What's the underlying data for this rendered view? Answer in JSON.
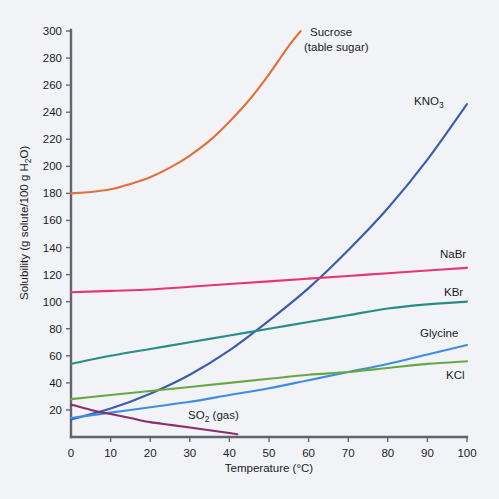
{
  "chart_data": {
    "type": "line",
    "title": "",
    "xlabel": "Temperature (°C)",
    "ylabel": "Solubility (g solute/100 g H₂O)",
    "xlim": [
      0,
      100
    ],
    "ylim": [
      0,
      300
    ],
    "grid": false,
    "legend_position": "inline-end-of-curve",
    "xticks": [
      0,
      10,
      20,
      30,
      40,
      50,
      60,
      70,
      80,
      90,
      100
    ],
    "yticks": [
      0,
      20,
      40,
      60,
      80,
      100,
      120,
      140,
      160,
      180,
      200,
      220,
      240,
      260,
      280,
      300
    ],
    "xtick_labels": [
      "0",
      "10",
      "20",
      "30",
      "40",
      "50",
      "60",
      "70",
      "80",
      "90",
      "100"
    ],
    "ytick_labels": [
      "",
      "20",
      "40",
      "60",
      "80",
      "100",
      "120",
      "140",
      "160",
      "180",
      "200",
      "220",
      "240",
      "260",
      "280",
      "300"
    ],
    "series": [
      {
        "name": "Sucrose (table sugar)",
        "label_lines": [
          "Sucrose",
          "(table sugar)"
        ],
        "color": "#e2703a",
        "x": [
          0,
          5,
          10,
          15,
          20,
          25,
          30,
          35,
          40,
          45,
          50,
          55,
          58
        ],
        "values": [
          180,
          181,
          183,
          187,
          192,
          199,
          208,
          219,
          233,
          249,
          268,
          289,
          300
        ]
      },
      {
        "name": "KNO3",
        "label_lines": [
          "KNO",
          "3"
        ],
        "color": "#3b5ca8",
        "x": [
          0,
          10,
          20,
          30,
          40,
          50,
          60,
          70,
          80,
          90,
          100
        ],
        "values": [
          13,
          21,
          32,
          46,
          64,
          86,
          110,
          138,
          169,
          205,
          246
        ]
      },
      {
        "name": "NaBr",
        "label_lines": [
          "NaBr"
        ],
        "color": "#e8356d",
        "x": [
          0,
          10,
          20,
          30,
          40,
          50,
          60,
          70,
          80,
          90,
          100
        ],
        "values": [
          107,
          108,
          109,
          111,
          113,
          115,
          117,
          119,
          121,
          123,
          125
        ]
      },
      {
        "name": "KBr",
        "label_lines": [
          "KBr"
        ],
        "color": "#2a8c86",
        "x": [
          0,
          10,
          20,
          30,
          40,
          50,
          60,
          70,
          80,
          90,
          100
        ],
        "values": [
          54,
          60,
          65,
          70,
          75,
          80,
          85,
          90,
          95,
          98,
          100
        ]
      },
      {
        "name": "Glycine",
        "label_lines": [
          "Glycine"
        ],
        "color": "#3c8fe0",
        "x": [
          0,
          10,
          20,
          30,
          40,
          50,
          60,
          70,
          80,
          90,
          100
        ],
        "values": [
          14,
          18,
          22,
          26,
          31,
          36,
          42,
          48,
          54,
          61,
          68
        ]
      },
      {
        "name": "KCl",
        "label_lines": [
          "KCl"
        ],
        "color": "#67a844",
        "x": [
          0,
          10,
          20,
          30,
          40,
          50,
          60,
          70,
          80,
          90,
          100
        ],
        "values": [
          28,
          31,
          34,
          37,
          40,
          43,
          46,
          48,
          51,
          54,
          56
        ]
      },
      {
        "name": "SO2 (gas)",
        "label_lines": [
          "SO",
          "2",
          " (gas)"
        ],
        "color": "#8e2b6b",
        "x": [
          0,
          5,
          10,
          15,
          20,
          25,
          30,
          35,
          40,
          42
        ],
        "values": [
          24,
          20,
          17,
          14,
          11,
          9,
          7,
          5,
          3,
          2
        ]
      }
    ],
    "annotations": [
      {
        "text": "Sucrose",
        "x_px": 310,
        "y_px": 32
      },
      {
        "text": "(table sugar)",
        "x_px": 310,
        "y_px": 47
      },
      {
        "text": "KNO3",
        "x_px": 415,
        "y_px": 101
      },
      {
        "text": "NaBr",
        "x_px": 440,
        "y_px": 254
      },
      {
        "text": "KBr",
        "x_px": 444,
        "y_px": 292
      },
      {
        "text": "Glycine",
        "x_px": 425,
        "y_px": 333
      },
      {
        "text": "KCl",
        "x_px": 446,
        "y_px": 375
      },
      {
        "text": "SO2 (gas)",
        "x_px": 191,
        "y_px": 415
      }
    ]
  },
  "axes": {
    "y_axis_title": "Solubility (g solute/100 g H₂O)",
    "x_axis_title": "Temperature (°C)",
    "y_labels": [
      "300",
      "280",
      "260",
      "240",
      "220",
      "200",
      "180",
      "160",
      "140",
      "120",
      "100",
      "80",
      "60",
      "40",
      "20"
    ],
    "x_labels": [
      "0",
      "10",
      "20",
      "30",
      "40",
      "50",
      "60",
      "70",
      "80",
      "90",
      "100"
    ]
  },
  "series_labels": {
    "sucrose_line1": "Sucrose",
    "sucrose_line2": "(table sugar)",
    "kno3_main": "KNO",
    "kno3_sub": "3",
    "nabr": "NaBr",
    "kbr": "KBr",
    "glycine": "Glycine",
    "kcl": "KCl",
    "so2_main": "SO",
    "so2_sub": "2",
    "so2_tail": " (gas)"
  },
  "colors": {
    "background": "#f1f3f7",
    "axis": "#62656e",
    "text": "#1b1b1f",
    "sucrose": "#e2703a",
    "kno3": "#3b5ca8",
    "nabr": "#e8356d",
    "kbr": "#2a8c86",
    "glycine": "#3c8fe0",
    "kcl": "#67a844",
    "so2": "#8e2b6b"
  }
}
